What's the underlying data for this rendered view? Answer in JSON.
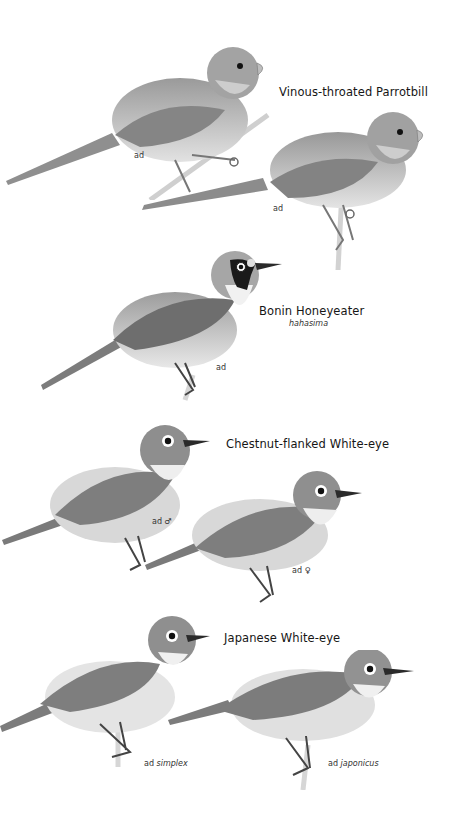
{
  "plate": {
    "background": "#ffffff",
    "species": [
      {
        "name": "Vinous-throated Parrotbill",
        "subspecies": null,
        "figures": [
          {
            "age": "ad",
            "qualifier": ""
          },
          {
            "age": "ad",
            "qualifier": ""
          }
        ]
      },
      {
        "name": "Bonin Honeyeater",
        "subspecies": "hahasima",
        "figures": [
          {
            "age": "ad",
            "qualifier": ""
          }
        ]
      },
      {
        "name": "Chestnut-flanked White-eye",
        "subspecies": null,
        "figures": [
          {
            "age": "ad",
            "qualifier": "♂"
          },
          {
            "age": "ad",
            "qualifier": "♀"
          }
        ]
      },
      {
        "name": "Japanese White-eye",
        "subspecies": null,
        "figures": [
          {
            "age": "ad",
            "qualifier": "simplex"
          },
          {
            "age": "ad",
            "qualifier": "japonicus"
          }
        ]
      }
    ]
  }
}
